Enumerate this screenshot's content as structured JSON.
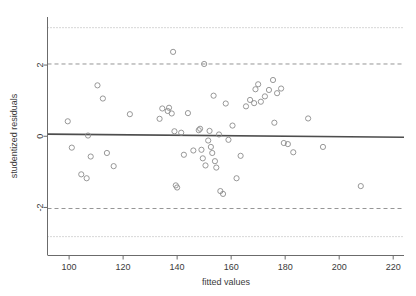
{
  "chart_data": {
    "type": "scatter",
    "title": "",
    "xlabel": "fitted values",
    "ylabel": "studentized residuals",
    "xlim": [
      92,
      224
    ],
    "ylim": [
      -3.35,
      3.35
    ],
    "xticks": [
      100,
      120,
      140,
      160,
      180,
      200,
      220
    ],
    "yticks": [
      2,
      0,
      -2
    ],
    "ytick_labels": [
      "2",
      "0",
      "-2"
    ],
    "grid": false,
    "legend": null,
    "reference_lines": [
      {
        "name": "upper-outer-bound",
        "y": 3.05,
        "style": "dotted",
        "color": "#9a9a9a"
      },
      {
        "name": "upper-inner-bound",
        "y": 2.03,
        "style": "dashed",
        "color": "#8a8a8a"
      },
      {
        "name": "lower-inner-bound",
        "y": -2.03,
        "style": "dashed",
        "color": "#8a8a8a"
      },
      {
        "name": "lower-outer-bound",
        "y": -2.82,
        "style": "dotted",
        "color": "#9a9a9a"
      }
    ],
    "fit_line": {
      "name": "loess-fit-line",
      "x0": 92,
      "y0": 0.06,
      "x1": 224,
      "y1": -0.03,
      "color": "#4d4d4d"
    },
    "marker": {
      "shape": "open-circle",
      "radius": 2.6,
      "color": "#8c8c8c"
    },
    "points": [
      {
        "x": 99.5,
        "y": 0.42
      },
      {
        "x": 101.0,
        "y": -0.32
      },
      {
        "x": 104.5,
        "y": -1.07
      },
      {
        "x": 106.5,
        "y": -1.18
      },
      {
        "x": 107.0,
        "y": 0.02
      },
      {
        "x": 108.0,
        "y": -0.57
      },
      {
        "x": 110.5,
        "y": 1.43
      },
      {
        "x": 112.5,
        "y": 1.06
      },
      {
        "x": 114.0,
        "y": -0.47
      },
      {
        "x": 116.5,
        "y": -0.84
      },
      {
        "x": 122.5,
        "y": 0.62
      },
      {
        "x": 133.5,
        "y": 0.49
      },
      {
        "x": 134.5,
        "y": 0.78
      },
      {
        "x": 136.5,
        "y": 0.71
      },
      {
        "x": 137.0,
        "y": 0.8
      },
      {
        "x": 138.0,
        "y": 0.64
      },
      {
        "x": 138.5,
        "y": 2.37
      },
      {
        "x": 139.0,
        "y": 0.14
      },
      {
        "x": 139.5,
        "y": -1.38
      },
      {
        "x": 140.0,
        "y": -1.44
      },
      {
        "x": 141.5,
        "y": 0.1
      },
      {
        "x": 142.5,
        "y": -0.52
      },
      {
        "x": 144.0,
        "y": 0.65
      },
      {
        "x": 146.0,
        "y": -0.4
      },
      {
        "x": 148.0,
        "y": 0.17
      },
      {
        "x": 148.5,
        "y": 0.21
      },
      {
        "x": 149.0,
        "y": -0.38
      },
      {
        "x": 149.5,
        "y": -0.62
      },
      {
        "x": 150.0,
        "y": 2.03
      },
      {
        "x": 150.5,
        "y": -0.82
      },
      {
        "x": 151.5,
        "y": -0.12
      },
      {
        "x": 152.0,
        "y": 0.15
      },
      {
        "x": 152.5,
        "y": -0.3
      },
      {
        "x": 153.0,
        "y": -0.47
      },
      {
        "x": 153.5,
        "y": 1.14
      },
      {
        "x": 154.0,
        "y": -0.7
      },
      {
        "x": 154.5,
        "y": -0.88
      },
      {
        "x": 155.5,
        "y": 0.05
      },
      {
        "x": 156.0,
        "y": -1.54
      },
      {
        "x": 157.0,
        "y": -1.62
      },
      {
        "x": 158.0,
        "y": 0.92
      },
      {
        "x": 159.0,
        "y": -0.1
      },
      {
        "x": 160.5,
        "y": 0.3
      },
      {
        "x": 162.0,
        "y": -1.18
      },
      {
        "x": 163.5,
        "y": -0.55
      },
      {
        "x": 165.5,
        "y": 0.84
      },
      {
        "x": 167.0,
        "y": 1.02
      },
      {
        "x": 168.5,
        "y": 0.93
      },
      {
        "x": 169.0,
        "y": 1.32
      },
      {
        "x": 170.0,
        "y": 1.46
      },
      {
        "x": 171.0,
        "y": 0.97
      },
      {
        "x": 172.5,
        "y": 1.12
      },
      {
        "x": 174.0,
        "y": 1.3
      },
      {
        "x": 175.5,
        "y": 1.58
      },
      {
        "x": 176.0,
        "y": 0.38
      },
      {
        "x": 177.0,
        "y": 1.21
      },
      {
        "x": 178.5,
        "y": 1.34
      },
      {
        "x": 179.5,
        "y": -0.19
      },
      {
        "x": 181.0,
        "y": -0.22
      },
      {
        "x": 183.0,
        "y": -0.45
      },
      {
        "x": 188.5,
        "y": 0.5
      },
      {
        "x": 194.0,
        "y": -0.3
      },
      {
        "x": 208.0,
        "y": -1.4
      }
    ]
  },
  "figure": {
    "xlabel": "fitted values",
    "ylabel": "studentized residuals",
    "xtick_labels": [
      "100",
      "120",
      "140",
      "160",
      "180",
      "200",
      "220"
    ],
    "ytick_labels": [
      "2",
      "0",
      "-2"
    ]
  }
}
